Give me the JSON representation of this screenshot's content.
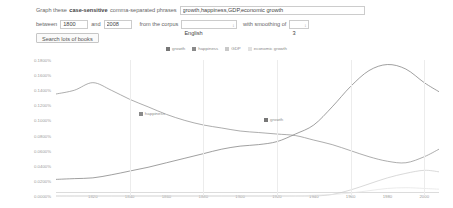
{
  "form": {
    "prefix_1": "Graph these",
    "prefix_bold": "case-sensitive",
    "prefix_2": "comma-separated phrases",
    "phrases_value": "growth,happiness,GDP,economic growth",
    "phrases_placeholder": "",
    "between_label": "between",
    "year_start": "1800",
    "and_label": "and",
    "year_end": "2008",
    "corpus_label": "from the corpus",
    "corpus_value": "English",
    "corpus_options": [
      "English",
      "American English",
      "British English",
      "English Fiction"
    ],
    "smoothing_label": "with smoothing of",
    "smoothing_value": "3",
    "smoothing_options": [
      "0",
      "1",
      "2",
      "3",
      "10",
      "20",
      "50"
    ],
    "dropdown_arrow": "↕",
    "search_button": "Search lots of books"
  },
  "chart_data": {
    "type": "line",
    "title": "",
    "xlabel": "",
    "ylabel": "",
    "xlim": [
      1800,
      2008
    ],
    "ylim": [
      0.0,
      0.0018
    ],
    "grid": true,
    "legend_position": "top-center",
    "xticks": [
      1820,
      1840,
      1860,
      1880,
      1900,
      1920,
      1940,
      1960,
      1980,
      2000
    ],
    "xtick_labels": [
      "1820",
      "1840",
      "1860",
      "1880",
      "1900",
      "1920",
      "1940",
      "1960",
      "1980",
      "2000"
    ],
    "yticks": [
      0.0,
      0.0002,
      0.0004,
      0.0006,
      0.0008,
      0.001,
      0.0012,
      0.0014,
      0.0016,
      0.0018
    ],
    "ytick_labels": [
      "0.0000%",
      "0.0200%",
      "0.0400%",
      "0.0600%",
      "0.0800%",
      "0.1000%",
      "0.1200%",
      "0.1400%",
      "0.1600%",
      "0.1800%"
    ],
    "legend": [
      {
        "name": "growth",
        "color": "#777777"
      },
      {
        "name": "happiness",
        "color": "#8a8a8a"
      },
      {
        "name": "GDP",
        "color": "#c9c9c9"
      },
      {
        "name": "economic growth",
        "color": "#e2e2e2"
      }
    ],
    "inline_labels": [
      {
        "name": "happiness",
        "x": 1845,
        "y": 0.00108,
        "color": "#8a8a8a"
      },
      {
        "name": "growth",
        "x": 1913,
        "y": 0.001,
        "color": "#777777"
      }
    ],
    "x": [
      1800,
      1810,
      1820,
      1830,
      1840,
      1850,
      1860,
      1870,
      1880,
      1890,
      1900,
      1910,
      1920,
      1930,
      1940,
      1950,
      1960,
      1970,
      1980,
      1990,
      2000,
      2008
    ],
    "series": [
      {
        "name": "growth",
        "color": "#777777",
        "values": [
          0.00022,
          0.00023,
          0.00024,
          0.00028,
          0.00033,
          0.00038,
          0.00044,
          0.0005,
          0.00056,
          0.00062,
          0.00066,
          0.00068,
          0.00072,
          0.00082,
          0.00094,
          0.00118,
          0.00145,
          0.00166,
          0.00174,
          0.00168,
          0.0015,
          0.00138
        ]
      },
      {
        "name": "happiness",
        "color": "#8a8a8a",
        "values": [
          0.00135,
          0.0014,
          0.0015,
          0.0014,
          0.00128,
          0.00118,
          0.00108,
          0.001,
          0.00094,
          0.0009,
          0.00086,
          0.00084,
          0.00082,
          0.0008,
          0.00074,
          0.00068,
          0.0006,
          0.00052,
          0.00046,
          0.00044,
          0.00052,
          0.00062
        ]
      },
      {
        "name": "GDP",
        "color": "#c9c9c9",
        "values": [
          0.0,
          0.0,
          0.0,
          0.0,
          0.0,
          0.0,
          0.0,
          0.0,
          0.0,
          0.0,
          0.0,
          0.0,
          0.0,
          0.0,
          0.0,
          2e-05,
          8e-05,
          0.00016,
          0.00024,
          0.0003,
          0.00034,
          0.00032
        ]
      },
      {
        "name": "economic growth",
        "color": "#e2e2e2",
        "values": [
          0.0,
          0.0,
          0.0,
          0.0,
          0.0,
          0.0,
          0.0,
          0.0,
          0.0,
          0.0,
          0.0,
          0.0,
          0.0,
          0.0,
          1e-05,
          2e-05,
          4e-05,
          7e-05,
          0.0001,
          0.00011,
          0.0001,
          9e-05
        ]
      }
    ]
  }
}
